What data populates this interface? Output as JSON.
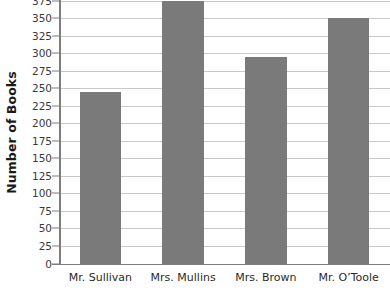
{
  "chart_data": {
    "type": "bar",
    "title": "",
    "xlabel": "",
    "ylabel": "Number of Books",
    "categories": [
      "Mr. Sullivan",
      "Mrs. Mullins",
      "Mrs. Brown",
      "Mr. O’Toole"
    ],
    "values": [
      244,
      375,
      294,
      350
    ],
    "ylim": [
      0,
      375
    ],
    "ytick_step": 25,
    "yticks": [
      0,
      25,
      50,
      75,
      100,
      125,
      150,
      175,
      200,
      225,
      250,
      275,
      300,
      325,
      350,
      375
    ],
    "ytick_labels": [
      "0",
      "25",
      "50",
      "75",
      "100",
      "125",
      "150",
      "175",
      "200",
      "225",
      "250",
      "275",
      "300",
      "325",
      "350",
      "375"
    ],
    "grid": true,
    "grid_axis": "y",
    "legend": false,
    "legend_position": "none",
    "series": [
      {
        "name": "Number of Books",
        "values": [
          244,
          375,
          294,
          350
        ]
      }
    ],
    "colors": {
      "bar": "#7a7a7a",
      "gridline": "#c9c9c9",
      "axis": "#7d7d7d",
      "background": "#ffffff",
      "tick_label": "#3a3a3a",
      "axis_title": "#1a1a1a"
    }
  }
}
